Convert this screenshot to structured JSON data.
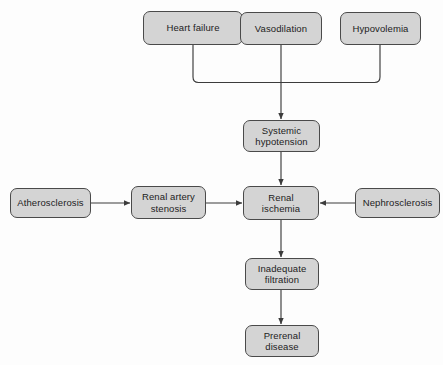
{
  "diagram": {
    "type": "flowchart",
    "background_color": "#fdfdfd",
    "node_fill_color": "#d4d4d4",
    "node_border_color": "#4a4a4a",
    "edge_color": "#3c3c3c",
    "nodes": [
      {
        "id": "heart-failure",
        "label": "Heart failure",
        "x": 143,
        "y": 11,
        "w": 100,
        "h": 34
      },
      {
        "id": "vasodilation",
        "label": "Vasodilation",
        "x": 240,
        "y": 12,
        "w": 82,
        "h": 33
      },
      {
        "id": "hypovolemia",
        "label": "Hypovolemia",
        "x": 340,
        "y": 12,
        "w": 81,
        "h": 33
      },
      {
        "id": "systemic-hypotension",
        "label": "Systemic\nhypotension",
        "x": 243,
        "y": 120,
        "w": 77,
        "h": 32
      },
      {
        "id": "atherosclerosis",
        "label": "Atherosclerosis",
        "x": 10,
        "y": 188,
        "w": 81,
        "h": 30
      },
      {
        "id": "renal-artery-stenosis",
        "label": "Renal artery\nstenosis",
        "x": 131,
        "y": 186,
        "w": 75,
        "h": 33
      },
      {
        "id": "renal-ischemia",
        "label": "Renal\nischemia",
        "x": 243,
        "y": 186,
        "w": 76,
        "h": 34
      },
      {
        "id": "nephrosclerosis",
        "label": "Nephrosclerosis",
        "x": 355,
        "y": 188,
        "w": 85,
        "h": 30
      },
      {
        "id": "inadequate-filtration",
        "label": "Inadequate\nfiltration",
        "x": 245,
        "y": 258,
        "w": 74,
        "h": 32
      },
      {
        "id": "prerenal-disease",
        "label": "Prerenal\ndisease",
        "x": 245,
        "y": 325,
        "w": 74,
        "h": 32
      }
    ],
    "edges": [
      {
        "id": "heart-failure-to-junction",
        "from": "heart-failure",
        "to": "junction",
        "arrow": false
      },
      {
        "id": "vasodilation-to-junction",
        "from": "vasodilation",
        "to": "junction",
        "arrow": false
      },
      {
        "id": "hypovolemia-to-junction",
        "from": "hypovolemia",
        "to": "junction",
        "arrow": false
      },
      {
        "id": "junction-to-systemic-hypotension",
        "from": "junction",
        "to": "systemic-hypotension",
        "arrow": true
      },
      {
        "id": "systemic-hypotension-to-renal-ischemia",
        "from": "systemic-hypotension",
        "to": "renal-ischemia",
        "arrow": true
      },
      {
        "id": "atherosclerosis-to-renal-artery-stenosis",
        "from": "atherosclerosis",
        "to": "renal-artery-stenosis",
        "arrow": true
      },
      {
        "id": "renal-artery-stenosis-to-renal-ischemia",
        "from": "renal-artery-stenosis",
        "to": "renal-ischemia",
        "arrow": true
      },
      {
        "id": "nephrosclerosis-to-renal-ischemia",
        "from": "nephrosclerosis",
        "to": "renal-ischemia",
        "arrow": true
      },
      {
        "id": "renal-ischemia-to-inadequate-filtration",
        "from": "renal-ischemia",
        "to": "inadequate-filtration",
        "arrow": true
      },
      {
        "id": "inadequate-filtration-to-prerenal-disease",
        "from": "inadequate-filtration",
        "to": "prerenal-disease",
        "arrow": true
      }
    ]
  }
}
